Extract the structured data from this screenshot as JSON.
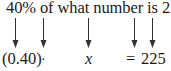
{
  "question": {
    "text": "40% of what number is 225?"
  },
  "arrows": [
    {
      "name": "arrow-40-percent",
      "x": 12
    },
    {
      "name": "arrow-of",
      "x": 40
    },
    {
      "name": "arrow-what-number",
      "x": 85
    },
    {
      "name": "arrow-is",
      "x": 131
    },
    {
      "name": "arrow-225",
      "x": 149
    }
  ],
  "equation": {
    "percent_decimal": "(0.40)",
    "times": "·",
    "variable": "x",
    "equals": "=",
    "value": "225"
  },
  "colors": {
    "text": "#1a1a1a",
    "arrow": "#333333",
    "background": "#ffffff"
  }
}
